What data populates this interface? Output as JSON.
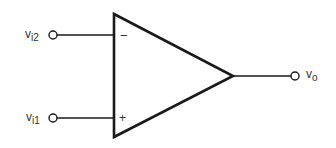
{
  "diagram": {
    "type": "op-amp symbol",
    "colors": {
      "stroke": "#1a1a1a",
      "text": "#333333",
      "background": "#ffffff"
    },
    "inputs": [
      {
        "id": "inverting",
        "label_main": "v",
        "label_sub": "i2",
        "sign": "−"
      },
      {
        "id": "noninverting",
        "label_main": "v",
        "label_sub": "i1",
        "sign": "+"
      }
    ],
    "output": {
      "label_main": "v",
      "label_sub": "o"
    }
  }
}
